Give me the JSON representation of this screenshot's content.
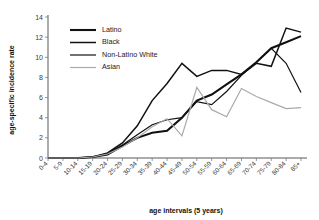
{
  "chart_data": {
    "type": "line",
    "title": "",
    "xlabel": "age intervals (5 years)",
    "ylabel": "age-specific incidence rate",
    "ylim": [
      0,
      14
    ],
    "ytick_step": 2,
    "yticks": [
      0,
      2,
      4,
      6,
      8,
      10,
      12,
      14
    ],
    "grid": false,
    "legend_position": "top-left",
    "categories": [
      "0-4",
      "5-9",
      "10-14",
      "15-19",
      "20-24",
      "25-29",
      "30-34",
      "35-39",
      "40-44",
      "45-49",
      "50-54",
      "55-59",
      "60-64",
      "65-69",
      "70-74",
      "75-79",
      "80-84",
      "85+"
    ],
    "series": [
      {
        "name": "Latino",
        "color": "#111111",
        "width": 2.1,
        "values": [
          0,
          0,
          0,
          0.1,
          0.35,
          1.2,
          2.0,
          2.5,
          2.7,
          4.0,
          5.7,
          6.3,
          7.3,
          8.3,
          9.5,
          10.9,
          11.5,
          12.1
        ]
      },
      {
        "name": "Black",
        "color": "#111111",
        "width": 1.5,
        "values": [
          0,
          0,
          0,
          0.1,
          0.5,
          1.5,
          3.2,
          5.7,
          7.4,
          9.4,
          8.1,
          8.7,
          8.7,
          8.3,
          9.4,
          9.1,
          12.9,
          12.5
        ]
      },
      {
        "name": "Non-Latino White",
        "color": "#111111",
        "width": 1.2,
        "values": [
          0,
          0,
          0,
          0.1,
          0.45,
          1.3,
          2.3,
          3.3,
          3.8,
          4.0,
          5.6,
          5.3,
          6.6,
          8.2,
          9.5,
          10.9,
          9.4,
          6.5
        ]
      },
      {
        "name": "Asian",
        "color": "#a9a9a9",
        "width": 1.2,
        "values": [
          0,
          0,
          0,
          0.1,
          0.4,
          1.1,
          2.0,
          3.1,
          3.9,
          2.2,
          7.0,
          4.8,
          4.1,
          6.9,
          6.1,
          5.5,
          4.9,
          5.0
        ]
      }
    ]
  },
  "legend": {
    "items": [
      {
        "label": "Latino"
      },
      {
        "label": "Black"
      },
      {
        "label": "Non-Latino White"
      },
      {
        "label": "Asian"
      }
    ]
  },
  "axes": {
    "y_title": "age-specific incidence rate",
    "x_title": "age intervals (5 years)"
  }
}
